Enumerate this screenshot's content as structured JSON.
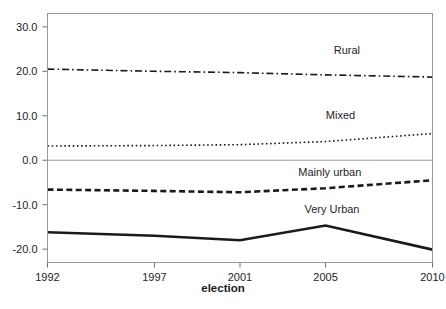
{
  "chart_data": {
    "type": "line",
    "title": "",
    "xlabel": "election",
    "ylabel": "",
    "x": [
      1992,
      1997,
      2001,
      2005,
      2010
    ],
    "xtick_labels": [
      "1992",
      "1997",
      "2001",
      "2005",
      "2010"
    ],
    "ytick_labels": [
      "30.0",
      "20.0",
      "10.0",
      "0.0",
      "-10.0",
      "-20.0"
    ],
    "ytick_values": [
      30.0,
      20.0,
      10.0,
      0.0,
      -10.0,
      -20.0
    ],
    "ylim": [
      -23.0,
      33.0
    ],
    "xlim": [
      1992,
      2010
    ],
    "grid": false,
    "legend_position": "inline-annotations",
    "zero_line": true,
    "series": [
      {
        "name": "Rural",
        "label": "Rural",
        "style": "dash-dot",
        "color": "#1a1a1a",
        "width": 1.6,
        "values": [
          20.5,
          20.0,
          19.7,
          19.2,
          18.7
        ],
        "label_x": 2006.0,
        "label_y": 24.0
      },
      {
        "name": "Mixed",
        "label": "Mixed",
        "style": "dotted",
        "color": "#1a1a1a",
        "width": 1.6,
        "values": [
          3.2,
          3.3,
          3.5,
          4.2,
          6.0
        ],
        "label_x": 2005.7,
        "label_y": 9.2
      },
      {
        "name": "Mainly urban",
        "label": "Mainly urban",
        "style": "dashed",
        "color": "#1a1a1a",
        "width": 2.6,
        "values": [
          -6.6,
          -6.9,
          -7.2,
          -6.3,
          -4.5
        ],
        "label_x": 2005.2,
        "label_y": -3.6
      },
      {
        "name": "Very Urban",
        "label": "Very Urban",
        "style": "solid",
        "color": "#1a1a1a",
        "width": 2.6,
        "values": [
          -16.2,
          -17.0,
          -18.0,
          -14.7,
          -20.1
        ],
        "label_x": 2005.3,
        "label_y": -11.9
      }
    ]
  }
}
